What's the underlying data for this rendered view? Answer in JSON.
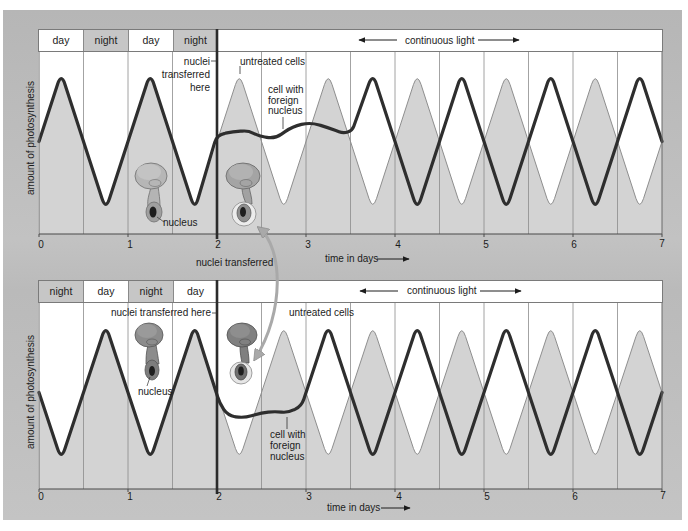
{
  "top_panel": {
    "header": {
      "cells": [
        {
          "label": "day"
        },
        {
          "label": "night"
        },
        {
          "label": "day"
        },
        {
          "label": "night"
        }
      ],
      "continuous_light": "continuous light"
    },
    "y_axis_label": "amount of photosynthesis",
    "x_axis_label": "time in days",
    "x_ticks": [
      "0",
      "1",
      "2",
      "3",
      "4",
      "5",
      "6",
      "7"
    ],
    "annotations": {
      "nuclei_transferred_here": [
        "nuclei",
        "transferred",
        "here"
      ],
      "untreated_cells": "untreated cells",
      "cell_with_foreign_nucleus": [
        "cell with",
        "foreign",
        "nucleus"
      ],
      "nucleus": "nucleus"
    }
  },
  "between_label": "nuclei transferred",
  "bottom_panel": {
    "header": {
      "cells": [
        {
          "label": "night"
        },
        {
          "label": "day"
        },
        {
          "label": "night"
        },
        {
          "label": "day"
        }
      ],
      "continuous_light": "continuous light"
    },
    "y_axis_label": "amount of photosynthesis",
    "x_axis_label": "time in days",
    "x_ticks": [
      "0",
      "1",
      "2",
      "3",
      "4",
      "5",
      "6",
      "7"
    ],
    "annotations": {
      "nuclei_transferred_here": "nuclei transferred here",
      "untreated_cells": "untreated cells",
      "cell_with_foreign_nucleus": [
        "cell with",
        "foreign",
        "nucleus"
      ],
      "nucleus": "nucleus"
    }
  },
  "colors": {
    "fill": "#d3d3d3",
    "foreign_line": "#2e2e2e",
    "untreated_line": "#8e8e8e",
    "grid": "#8c8c8c",
    "transfer_arrow": "#a9a9a9"
  },
  "chart_data": [
    {
      "type": "line",
      "title": "",
      "xlabel": "time in days",
      "ylabel": "amount of photosynthesis",
      "xlim": [
        0,
        7
      ],
      "ylim": [
        0,
        1
      ],
      "y_units": "relative (unlabeled)",
      "x_ticks": [
        0,
        1,
        2,
        3,
        4,
        5,
        6,
        7
      ],
      "grid": "vertical lines every 0.5 day",
      "light_schedule": [
        "day 0-0.5",
        "night 0.5-1",
        "day 1-1.5",
        "night 1.5-2",
        "continuous light 2-7"
      ],
      "transfer_day": 2,
      "series": [
        {
          "name": "untreated cells",
          "role": "untreated",
          "points": [
            [
              0,
              0.5
            ],
            [
              0.25,
              1
            ],
            [
              0.75,
              0
            ],
            [
              1.25,
              1
            ],
            [
              1.75,
              0
            ],
            [
              2.25,
              1
            ],
            [
              2.75,
              0
            ],
            [
              3.25,
              1
            ],
            [
              3.75,
              0
            ],
            [
              4.25,
              1
            ],
            [
              4.75,
              0
            ],
            [
              5.25,
              1
            ],
            [
              5.75,
              0
            ],
            [
              6.25,
              1
            ],
            [
              6.75,
              0
            ],
            [
              7,
              0.5
            ]
          ]
        },
        {
          "name": "cell with foreign nucleus",
          "role": "foreign",
          "points": [
            [
              0,
              0.5
            ],
            [
              0.25,
              1
            ],
            [
              0.75,
              0
            ],
            [
              1.25,
              1
            ],
            [
              1.75,
              0
            ],
            [
              2.0,
              0.55
            ],
            [
              2.18,
              0.57
            ],
            [
              2.35,
              0.58
            ],
            [
              2.47,
              0.54
            ],
            [
              2.65,
              0.52
            ],
            [
              2.85,
              0.61
            ],
            [
              3.05,
              0.64
            ],
            [
              3.25,
              0.6
            ],
            [
              3.42,
              0.56
            ],
            [
              3.52,
              0.58
            ],
            [
              3.75,
              1
            ],
            [
              4.25,
              0
            ],
            [
              4.75,
              1
            ],
            [
              5.25,
              0
            ],
            [
              5.75,
              1
            ],
            [
              6.25,
              0
            ],
            [
              6.75,
              1
            ],
            [
              7,
              0.5
            ]
          ]
        }
      ]
    },
    {
      "type": "line",
      "title": "",
      "xlabel": "time in days",
      "ylabel": "amount of photosynthesis",
      "xlim": [
        0,
        7
      ],
      "ylim": [
        0,
        1
      ],
      "y_units": "relative (unlabeled)",
      "x_ticks": [
        0,
        1,
        2,
        3,
        4,
        5,
        6,
        7
      ],
      "grid": "vertical lines every 0.5 day",
      "light_schedule": [
        "night 0-0.5",
        "day 0.5-1",
        "night 1-1.5",
        "day 1.5-2",
        "continuous light 2-7"
      ],
      "transfer_day": 2,
      "series": [
        {
          "name": "untreated cells",
          "role": "untreated",
          "points": [
            [
              0,
              0.5
            ],
            [
              0.25,
              0
            ],
            [
              0.75,
              1
            ],
            [
              1.25,
              0
            ],
            [
              1.75,
              1
            ],
            [
              2.25,
              0
            ],
            [
              2.75,
              1
            ],
            [
              3.25,
              0
            ],
            [
              3.75,
              1
            ],
            [
              4.25,
              0
            ],
            [
              4.75,
              1
            ],
            [
              5.25,
              0
            ],
            [
              5.75,
              1
            ],
            [
              6.25,
              0
            ],
            [
              6.75,
              1
            ],
            [
              7,
              0.5
            ]
          ]
        },
        {
          "name": "cell with foreign nucleus",
          "role": "foreign",
          "points": [
            [
              0,
              0.5
            ],
            [
              0.25,
              0
            ],
            [
              0.75,
              1
            ],
            [
              1.25,
              0
            ],
            [
              1.75,
              1
            ],
            [
              2.03,
              0.42
            ],
            [
              2.12,
              0.33
            ],
            [
              2.3,
              0.31
            ],
            [
              2.5,
              0.35
            ],
            [
              2.65,
              0.36
            ],
            [
              2.8,
              0.35
            ],
            [
              2.95,
              0.4
            ],
            [
              3.25,
              1
            ],
            [
              3.75,
              0
            ],
            [
              4.25,
              1
            ],
            [
              4.75,
              0
            ],
            [
              5.25,
              1
            ],
            [
              5.75,
              0
            ],
            [
              6.25,
              1
            ],
            [
              6.75,
              0
            ],
            [
              7,
              0.5
            ]
          ]
        }
      ]
    }
  ]
}
